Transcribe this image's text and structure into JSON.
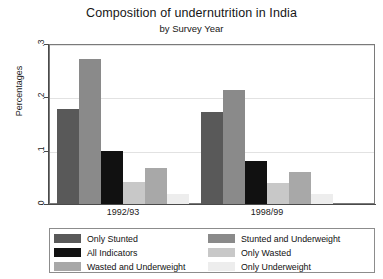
{
  "chart_data": {
    "type": "bar",
    "title": "Composition of undernutrition in India",
    "subtitle": "by Survey Year",
    "xlabel": "",
    "ylabel": "Percentages",
    "categories": [
      "1992/93",
      "1998/99"
    ],
    "ylim": [
      0,
      0.3
    ],
    "yticks": [
      "0",
      ".1",
      ".2",
      ".3"
    ],
    "ytick_values": [
      0,
      0.1,
      0.2,
      0.3
    ],
    "grid": true,
    "legend_position": "bottom",
    "series": [
      {
        "name": "Only Stunted",
        "color": "#595959",
        "values": [
          0.178,
          0.173
        ]
      },
      {
        "name": "Stunted and Underweight",
        "color": "#8a8a8a",
        "values": [
          0.272,
          0.213
        ]
      },
      {
        "name": "All Indicators",
        "color": "#111111",
        "values": [
          0.1,
          0.081
        ]
      },
      {
        "name": "Only Wasted",
        "color": "#c8c8c8",
        "values": [
          0.041,
          0.04
        ]
      },
      {
        "name": "Wasted and Underweight",
        "color": "#a8a8a8",
        "values": [
          0.067,
          0.06
        ]
      },
      {
        "name": "Only Underweight",
        "color": "#ededed",
        "values": [
          0.018,
          0.018
        ]
      }
    ]
  },
  "legend": {
    "column_left": [
      {
        "label": "Only Stunted",
        "color": "#595959"
      },
      {
        "label": "All Indicators",
        "color": "#111111"
      },
      {
        "label": "Wasted and Underweight",
        "color": "#a8a8a8"
      }
    ],
    "column_right": [
      {
        "label": "Stunted and Underweight",
        "color": "#8a8a8a"
      },
      {
        "label": "Only Wasted",
        "color": "#c8c8c8"
      },
      {
        "label": "Only Underweight",
        "color": "#ededed"
      }
    ]
  }
}
